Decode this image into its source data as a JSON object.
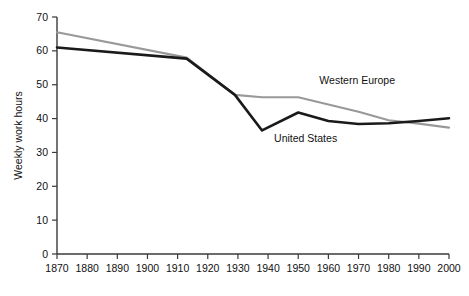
{
  "chart_data": {
    "type": "line",
    "title": "",
    "subtitle": "",
    "xlabel": "",
    "ylabel": "Weekly work hours",
    "xlim": [
      1870,
      2000
    ],
    "ylim": [
      0,
      70
    ],
    "grid": false,
    "legend_position": "inline-annotation",
    "x_ticks": [
      1870,
      1880,
      1890,
      1900,
      1910,
      1920,
      1930,
      1940,
      1950,
      1960,
      1970,
      1980,
      1990,
      2000
    ],
    "x_tick_labels": [
      "1870",
      "1880",
      "1890",
      "1900",
      "1910",
      "1920",
      "1930",
      "1940",
      "1950",
      "1960",
      "1970",
      "1980",
      "1990",
      "2000"
    ],
    "y_ticks": [
      0,
      10,
      20,
      30,
      40,
      50,
      60,
      70
    ],
    "y_tick_labels": [
      "0",
      "10",
      "20",
      "30",
      "40",
      "50",
      "60",
      "70"
    ],
    "series": [
      {
        "name": "Western Europe",
        "color": "#999999",
        "stroke_width": 2.2,
        "x": [
          1870,
          1913,
          1929,
          1938,
          1950,
          1970,
          1980,
          1990,
          2000
        ],
        "values": [
          65.5,
          58.0,
          47.0,
          46.3,
          46.3,
          42.0,
          39.5,
          38.5,
          37.3
        ]
      },
      {
        "name": "United States",
        "color": "#1a1a1a",
        "stroke_width": 2.6,
        "x": [
          1870,
          1913,
          1929,
          1938,
          1950,
          1960,
          1970,
          1980,
          1990,
          2000
        ],
        "values": [
          61.0,
          57.7,
          47.0,
          36.5,
          41.8,
          39.3,
          38.4,
          38.6,
          39.3,
          40.1
        ]
      }
    ],
    "annotations": [
      {
        "text": "Western Europe",
        "x": 1957,
        "y": 50.2,
        "anchor": "start"
      },
      {
        "text": "United States",
        "x": 1942,
        "y": 33.0,
        "anchor": "start"
      }
    ]
  }
}
